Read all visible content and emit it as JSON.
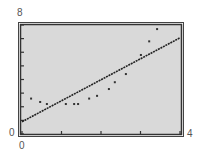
{
  "chart_data": {
    "type": "scatter",
    "title": "",
    "xlabel": "",
    "ylabel": "",
    "xlim": [
      0,
      4
    ],
    "ylim": [
      0,
      8
    ],
    "x_tick_labels": {
      "min": "0",
      "max": "4"
    },
    "y_tick_labels": {
      "min": "0",
      "max": "8"
    },
    "x_ticks": [
      0,
      1,
      2,
      3,
      4
    ],
    "y_ticks": [
      0,
      1,
      2,
      3,
      4,
      5,
      6,
      7,
      8
    ],
    "grid": false,
    "legend": null,
    "series": [
      {
        "name": "data points",
        "kind": "scatter",
        "points": [
          [
            0.23,
            2.6
          ],
          [
            0.46,
            2.35
          ],
          [
            0.63,
            2.2
          ],
          [
            1.11,
            2.2
          ],
          [
            1.32,
            2.2
          ],
          [
            1.42,
            2.2
          ],
          [
            1.7,
            2.6
          ],
          [
            1.9,
            2.8
          ],
          [
            2.2,
            3.3
          ],
          [
            2.35,
            3.8
          ],
          [
            2.63,
            4.4
          ],
          [
            3.01,
            5.8
          ],
          [
            3.22,
            6.8
          ],
          [
            3.42,
            7.7
          ]
        ]
      },
      {
        "name": "regression line",
        "kind": "line",
        "slope": 1.54,
        "intercept": 0.9,
        "points": [
          [
            0,
            0.9
          ],
          [
            4,
            7.06
          ]
        ]
      }
    ],
    "colors": {
      "plot_background": "#d9d9d9",
      "frame": "#333333",
      "points": "#333333",
      "line": "#222222"
    }
  },
  "labels": {
    "y_max": "8",
    "y_min": "0",
    "x_min": "0",
    "x_max": "4"
  }
}
